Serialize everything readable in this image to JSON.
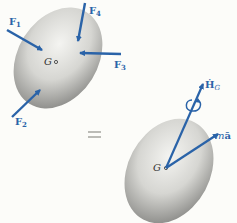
{
  "diagram": {
    "top_body": {
      "center_label": "G",
      "forces": [
        {
          "id": "F1",
          "label": "F",
          "sub": "1"
        },
        {
          "id": "F2",
          "label": "F",
          "sub": "2"
        },
        {
          "id": "F3",
          "label": "F",
          "sub": "3"
        },
        {
          "id": "F4",
          "label": "F",
          "sub": "4"
        }
      ]
    },
    "equals": "=",
    "bottom_body": {
      "center_label": "G",
      "vectors": [
        {
          "id": "HG_dot",
          "label": "Ḣ",
          "sub": "G"
        },
        {
          "id": "ma_bar",
          "label_m": "m",
          "label_a": "ā"
        }
      ]
    },
    "colors": {
      "arrow": "#2a63a8",
      "body": "#c8c8c4",
      "background": "#fcfcf9"
    }
  }
}
